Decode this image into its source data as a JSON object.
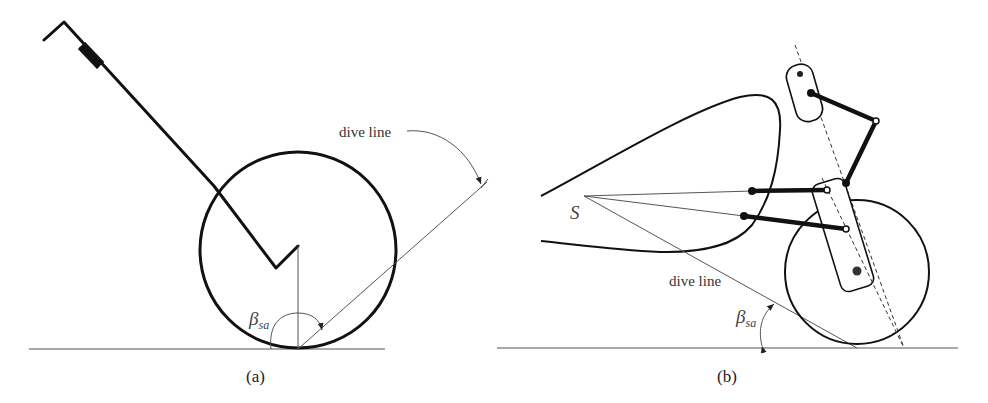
{
  "figure": {
    "panel_a": {
      "caption": "(a)",
      "dive_line_label": "dive line",
      "angle_symbol": "β",
      "angle_subscript": "sa"
    },
    "panel_b": {
      "caption": "(b)",
      "dive_line_label": "dive line",
      "point_label": "S",
      "angle_symbol": "β",
      "angle_subscript": "sa"
    }
  },
  "colors": {
    "stroke": "#111111",
    "thin_line": "#555555",
    "background": "#ffffff"
  }
}
